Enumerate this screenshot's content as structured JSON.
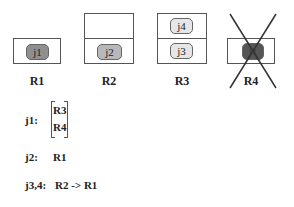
{
  "racks": [
    {
      "label": "R1",
      "jobs": [
        {
          "id": "j1",
          "color": "#8f8f8f"
        }
      ]
    },
    {
      "label": "R2",
      "jobs": [
        {
          "id": "j2",
          "color": "#b8b8b8"
        }
      ]
    },
    {
      "label": "R3",
      "jobs": [
        {
          "id": "j4",
          "color": "#e6e6e6"
        },
        {
          "id": "j3",
          "color": "#e6e6e6"
        }
      ]
    },
    {
      "label": "R4",
      "jobs": [
        {
          "id": "j1",
          "color": "#555555"
        }
      ],
      "crossed_out": true
    }
  ],
  "migrations": [
    {
      "job": "j1:",
      "targets": [
        "R3",
        "R4"
      ]
    },
    {
      "job": "j2:",
      "target": "R1"
    },
    {
      "job": "j3,4:",
      "target": "R2 -> R1"
    }
  ]
}
